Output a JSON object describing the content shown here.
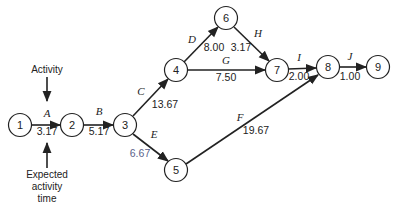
{
  "nodes": [
    {
      "id": "1",
      "label": "1",
      "x": 20,
      "y": 125
    },
    {
      "id": "2",
      "label": "2",
      "x": 72,
      "y": 125
    },
    {
      "id": "3",
      "label": "3",
      "x": 125,
      "y": 125
    },
    {
      "id": "4",
      "label": "4",
      "x": 176,
      "y": 70
    },
    {
      "id": "5",
      "label": "5",
      "x": 176,
      "y": 170
    },
    {
      "id": "6",
      "label": "6",
      "x": 226,
      "y": 18
    },
    {
      "id": "7",
      "label": "7",
      "x": 277,
      "y": 70
    },
    {
      "id": "8",
      "label": "8",
      "x": 328,
      "y": 67
    },
    {
      "id": "9",
      "label": "9",
      "x": 378,
      "y": 67
    }
  ],
  "activities": [
    {
      "name": "A",
      "from": "1",
      "to": "2",
      "time": "3.17"
    },
    {
      "name": "B",
      "from": "2",
      "to": "3",
      "time": "5.17"
    },
    {
      "name": "C",
      "from": "3",
      "to": "4",
      "time": "13.67"
    },
    {
      "name": "D",
      "from": "4",
      "to": "6",
      "time": "8.00"
    },
    {
      "name": "E",
      "from": "3",
      "to": "5",
      "time": "6.67"
    },
    {
      "name": "F",
      "from": "5",
      "to": "8",
      "time": "19.67"
    },
    {
      "name": "G",
      "from": "4",
      "to": "7",
      "time": "7.50"
    },
    {
      "name": "H",
      "from": "6",
      "to": "7",
      "time": "3.17"
    },
    {
      "name": "I",
      "from": "7",
      "to": "8",
      "time": "2.00"
    },
    {
      "name": "J",
      "from": "8",
      "to": "9",
      "time": "1.00"
    }
  ],
  "annotations": {
    "activity": "Activity",
    "expected_line1": "Expected",
    "expected_line2": "activity",
    "expected_line3": "time"
  },
  "colors": {
    "line": "#222222",
    "e_time": "#5a5f8a"
  }
}
